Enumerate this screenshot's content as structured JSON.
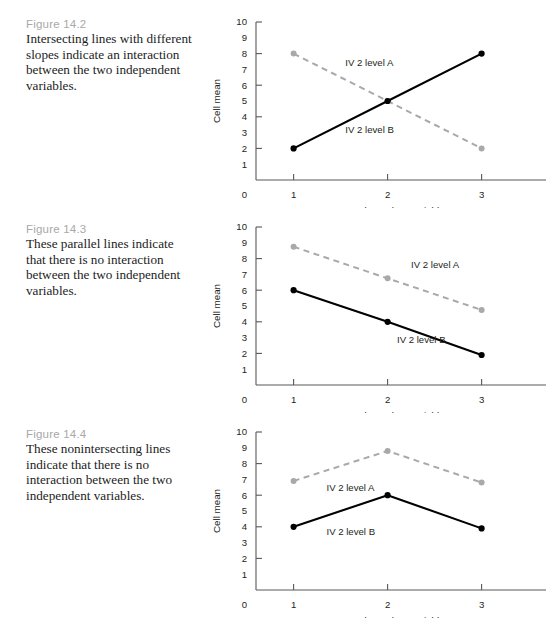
{
  "page": {
    "axis": {
      "y_label": "Cell mean",
      "x_label": "Independent variable 1",
      "y_ticks": [
        "10",
        "9",
        "8",
        "7",
        "6",
        "5",
        "4",
        "3",
        "2",
        "1"
      ],
      "y_tickmark_values": [
        10,
        8,
        6,
        4,
        2
      ],
      "x_ticks": [
        "1",
        "2",
        "3"
      ],
      "origin_label": "0",
      "ylim": [
        0,
        10
      ],
      "grid": false,
      "legend_position": "inline-annotation"
    },
    "colors": {
      "solid_series": "#000000",
      "dashed_series": "#a9a9a9",
      "axis": "#58585a",
      "figure_label": "#a8a8a8",
      "caption_text": "#1c1c1c"
    },
    "figures": [
      {
        "label": "Figure 14.2",
        "caption": "Intersecting lines with different slopes indicate an interaction between the two independent variables.",
        "series_a_label": "IV 2 level A",
        "series_b_label": "IV 2 level B"
      },
      {
        "label": "Figure 14.3",
        "caption": "These parallel lines indicate that there is no interaction between the two independent variables.",
        "series_a_label": "IV 2 level A",
        "series_b_label": "IV 2 level B"
      },
      {
        "label": "Figure 14.4",
        "caption": "These nonintersecting lines indicate that there is no interaction between the two independent variables.",
        "series_a_label": "IV 2 level A",
        "series_b_label": "IV 2 level B"
      }
    ]
  },
  "chart_data": [
    {
      "type": "line",
      "title": "Figure 14.2",
      "xlabel": "Independent variable 1",
      "ylabel": "Cell mean",
      "categories": [
        1,
        2,
        3
      ],
      "ylim": [
        0,
        10
      ],
      "xlim": [
        0.6,
        3.6
      ],
      "grid": false,
      "series": [
        {
          "name": "IV 2 level A",
          "style": "dashed",
          "color": "#a9a9a9",
          "values": [
            8.0,
            5.0,
            2.0
          ]
        },
        {
          "name": "IV 2 level B",
          "style": "solid",
          "color": "#000000",
          "values": [
            2.0,
            5.0,
            8.0
          ]
        }
      ],
      "annotations": [
        {
          "text": "IV 2 level A",
          "x": 1.55,
          "y": 7.2
        },
        {
          "text": "IV 2 level B",
          "x": 1.55,
          "y": 3.0
        }
      ]
    },
    {
      "type": "line",
      "title": "Figure 14.3",
      "xlabel": "Independent variable 1",
      "ylabel": "Cell mean",
      "categories": [
        1,
        2,
        3
      ],
      "ylim": [
        0,
        10
      ],
      "xlim": [
        0.6,
        3.6
      ],
      "grid": false,
      "series": [
        {
          "name": "IV 2 level A",
          "style": "dashed",
          "color": "#a9a9a9",
          "values": [
            8.75,
            6.75,
            4.75
          ]
        },
        {
          "name": "IV 2 level B",
          "style": "solid",
          "color": "#000000",
          "values": [
            6.0,
            4.0,
            1.9
          ]
        }
      ],
      "annotations": [
        {
          "text": "IV 2 level A",
          "x": 2.25,
          "y": 7.4
        },
        {
          "text": "IV 2 level B",
          "x": 2.1,
          "y": 2.65
        }
      ]
    },
    {
      "type": "line",
      "title": "Figure 14.4",
      "xlabel": "Independent variable 1",
      "ylabel": "Cell mean",
      "categories": [
        1,
        2,
        3
      ],
      "ylim": [
        0,
        10
      ],
      "xlim": [
        0.6,
        3.6
      ],
      "grid": false,
      "series": [
        {
          "name": "IV 2 level A",
          "style": "dashed",
          "color": "#a9a9a9",
          "values": [
            6.9,
            8.8,
            6.8
          ]
        },
        {
          "name": "IV 2 level B",
          "style": "solid",
          "color": "#000000",
          "values": [
            4.0,
            6.0,
            3.9
          ]
        }
      ],
      "annotations": [
        {
          "text": "IV 2 level A",
          "x": 1.35,
          "y": 6.25
        },
        {
          "text": "IV 2 level B",
          "x": 1.35,
          "y": 3.45
        }
      ]
    }
  ]
}
